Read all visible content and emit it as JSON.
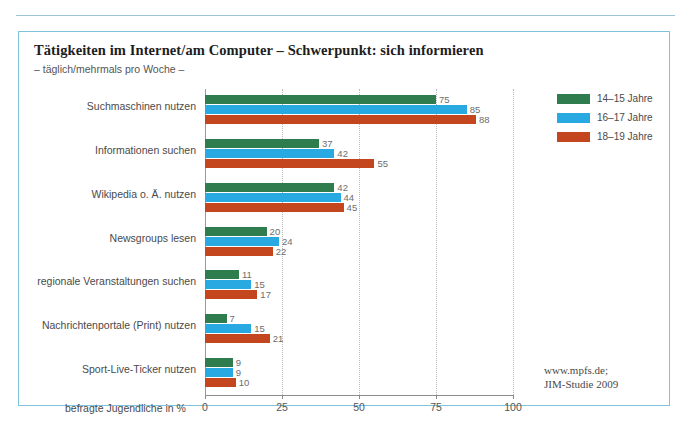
{
  "chart_data": {
    "type": "bar",
    "orientation": "horizontal",
    "title": "Tätigkeiten im Internet/am Computer – Schwerpunkt: sich informieren",
    "subtitle": "– täglich/mehrmals pro Woche –",
    "xlabel": "befragte Jugendliche in %",
    "ylabel": "",
    "xlim": [
      0,
      100
    ],
    "xticks": [
      0,
      25,
      50,
      75,
      100
    ],
    "xticklabels": [
      "0",
      "25",
      "50",
      "75",
      "100"
    ],
    "grid": true,
    "legend_position": "right-top",
    "categories": [
      "Suchmaschinen nutzen",
      "Informationen suchen",
      "Wikipedia o. Ä. nutzen",
      "Newsgroups lesen",
      "regionale Veranstaltungen suchen",
      "Nachrichtenportale (Print) nutzen",
      "Sport-Live-Ticker nutzen"
    ],
    "series": [
      {
        "name": "14–15 Jahre",
        "color": "#2f7d4f",
        "values": [
          75,
          37,
          42,
          20,
          11,
          7,
          9
        ]
      },
      {
        "name": "16–17 Jahre",
        "color": "#29a9e1",
        "values": [
          85,
          42,
          44,
          24,
          15,
          15,
          9
        ]
      },
      {
        "name": "18–19 Jahre",
        "color": "#c4461f",
        "values": [
          88,
          55,
          45,
          22,
          17,
          21,
          10
        ]
      }
    ],
    "source": {
      "line1": "www.mpfs.de;",
      "line2": "JIM-Studie 2009"
    }
  }
}
